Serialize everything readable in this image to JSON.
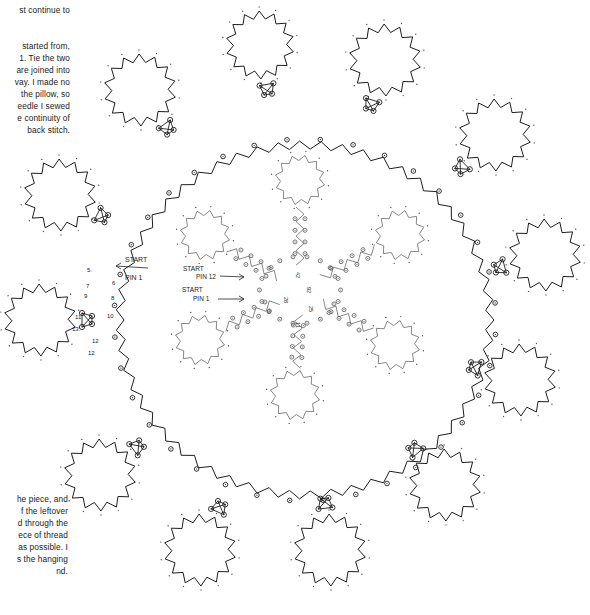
{
  "page": {
    "paragraph_top_a": [
      "st continue to"
    ],
    "paragraph_top_b": [
      "started from,",
      "1. Tie the two",
      "are joined into",
      "vay. I made no",
      "the pillow, so",
      "eedle I sewed",
      "e continuity of",
      "back stitch."
    ],
    "paragraph_bottom": [
      "he piece, and",
      "f the leftover",
      "d through the",
      "ece of thread",
      "as possible. I",
      "s the hanging",
      "nd."
    ]
  },
  "diagram": {
    "type": "lace-pricking",
    "colors": {
      "outer_line": "#1e1e1e",
      "inner_line": "#6a6a6a",
      "pin": "#333333"
    },
    "outer_labels": {
      "start": "START",
      "pin": "PIN 1",
      "numbers": [
        {
          "t": "5.",
          "x": 87,
          "y": 272
        },
        {
          "t": "6",
          "x": 112,
          "y": 285
        },
        {
          "t": "7",
          "x": 86,
          "y": 288
        },
        {
          "t": "8",
          "x": 111,
          "y": 300
        },
        {
          "t": "9",
          "x": 84,
          "y": 298
        },
        {
          "t": "10",
          "x": 107,
          "y": 318
        },
        {
          "t": "11",
          "x": 75,
          "y": 319
        },
        {
          "t": "13.",
          "x": 72,
          "y": 331
        },
        {
          "t": "12",
          "x": 92,
          "y": 343
        },
        {
          "t": "12",
          "x": 88,
          "y": 355
        }
      ]
    },
    "inner_labels": {
      "start_12_a": "START",
      "start_12_b": "PIN 12",
      "start_1_a": "START",
      "start_1_b": "PIN 1",
      "numbers": [
        {
          "t": "28",
          "x": 284,
          "y": 297
        },
        {
          "t": "42",
          "x": 296,
          "y": 272
        },
        {
          "t": "92",
          "x": 307,
          "y": 287
        },
        {
          "t": "25",
          "x": 309,
          "y": 306
        },
        {
          "t": "11",
          "x": 296,
          "y": 322
        }
      ]
    },
    "outer_flowers": [
      {
        "cx": 140,
        "cy": 90,
        "r": 36
      },
      {
        "cx": 260,
        "cy": 45,
        "r": 34
      },
      {
        "cx": 385,
        "cy": 60,
        "r": 36
      },
      {
        "cx": 495,
        "cy": 135,
        "r": 36
      },
      {
        "cx": 545,
        "cy": 255,
        "r": 36
      },
      {
        "cx": 520,
        "cy": 380,
        "r": 36
      },
      {
        "cx": 445,
        "cy": 485,
        "r": 36
      },
      {
        "cx": 330,
        "cy": 550,
        "r": 36
      },
      {
        "cx": 200,
        "cy": 550,
        "r": 36
      },
      {
        "cx": 100,
        "cy": 475,
        "r": 36
      },
      {
        "cx": 40,
        "cy": 320,
        "r": 36
      },
      {
        "cx": 60,
        "cy": 195,
        "r": 36
      }
    ],
    "ring": {
      "cx": 305,
      "cy": 320,
      "rx": 185,
      "ry": 175
    },
    "inner_flowers": [
      {
        "cx": 300,
        "cy": 180,
        "r": 25
      },
      {
        "cx": 400,
        "cy": 235,
        "r": 25
      },
      {
        "cx": 395,
        "cy": 345,
        "r": 25
      },
      {
        "cx": 295,
        "cy": 395,
        "r": 25
      },
      {
        "cx": 200,
        "cy": 340,
        "r": 25
      },
      {
        "cx": 205,
        "cy": 235,
        "r": 25
      }
    ],
    "inner_center": {
      "cx": 300,
      "cy": 290,
      "r": 45
    }
  }
}
